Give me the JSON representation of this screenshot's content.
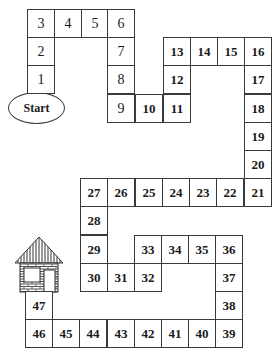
{
  "start_label": "Start",
  "goal": "house-icon",
  "colors": {
    "line": "#3a3a3a",
    "text": "#1a1a1a",
    "background": "#ffffff"
  },
  "cells": [
    {
      "n": "1",
      "x": 27,
      "y": 65,
      "bold": false
    },
    {
      "n": "2",
      "x": 27,
      "y": 37,
      "bold": false
    },
    {
      "n": "3",
      "x": 27,
      "y": 9,
      "bold": false
    },
    {
      "n": "4",
      "x": 54,
      "y": 9,
      "bold": false
    },
    {
      "n": "5",
      "x": 81,
      "y": 9,
      "bold": false
    },
    {
      "n": "6",
      "x": 107,
      "y": 9,
      "bold": false
    },
    {
      "n": "7",
      "x": 107,
      "y": 37,
      "bold": false
    },
    {
      "n": "8",
      "x": 107,
      "y": 65,
      "bold": false
    },
    {
      "n": "9",
      "x": 107,
      "y": 94,
      "bold": false
    },
    {
      "n": "10",
      "x": 135,
      "y": 94,
      "bold": true
    },
    {
      "n": "11",
      "x": 163,
      "y": 94,
      "bold": true
    },
    {
      "n": "12",
      "x": 163,
      "y": 65,
      "bold": true
    },
    {
      "n": "13",
      "x": 163,
      "y": 37,
      "bold": true
    },
    {
      "n": "14",
      "x": 190,
      "y": 37,
      "bold": true
    },
    {
      "n": "15",
      "x": 217,
      "y": 37,
      "bold": true
    },
    {
      "n": "16",
      "x": 244,
      "y": 37,
      "bold": true
    },
    {
      "n": "17",
      "x": 244,
      "y": 65,
      "bold": true
    },
    {
      "n": "18",
      "x": 244,
      "y": 94,
      "bold": true
    },
    {
      "n": "19",
      "x": 244,
      "y": 122,
      "bold": true
    },
    {
      "n": "20",
      "x": 244,
      "y": 150,
      "bold": true
    },
    {
      "n": "21",
      "x": 244,
      "y": 178,
      "bold": true
    },
    {
      "n": "22",
      "x": 216,
      "y": 178,
      "bold": true
    },
    {
      "n": "23",
      "x": 189,
      "y": 178,
      "bold": true
    },
    {
      "n": "24",
      "x": 162,
      "y": 178,
      "bold": true
    },
    {
      "n": "25",
      "x": 135,
      "y": 178,
      "bold": true
    },
    {
      "n": "26",
      "x": 107,
      "y": 178,
      "bold": true
    },
    {
      "n": "27",
      "x": 80,
      "y": 178,
      "bold": true
    },
    {
      "n": "28",
      "x": 80,
      "y": 206,
      "bold": true
    },
    {
      "n": "29",
      "x": 80,
      "y": 235,
      "bold": true
    },
    {
      "n": "30",
      "x": 80,
      "y": 263,
      "bold": true
    },
    {
      "n": "31",
      "x": 107,
      "y": 263,
      "bold": true
    },
    {
      "n": "32",
      "x": 134,
      "y": 263,
      "bold": true
    },
    {
      "n": "33",
      "x": 134,
      "y": 235,
      "bold": true
    },
    {
      "n": "34",
      "x": 161,
      "y": 235,
      "bold": true
    },
    {
      "n": "35",
      "x": 188,
      "y": 235,
      "bold": true
    },
    {
      "n": "36",
      "x": 215,
      "y": 235,
      "bold": true
    },
    {
      "n": "37",
      "x": 215,
      "y": 263,
      "bold": true
    },
    {
      "n": "38",
      "x": 215,
      "y": 291,
      "bold": true
    },
    {
      "n": "39",
      "x": 215,
      "y": 319,
      "bold": true
    },
    {
      "n": "40",
      "x": 188,
      "y": 319,
      "bold": true
    },
    {
      "n": "41",
      "x": 161,
      "y": 319,
      "bold": true
    },
    {
      "n": "42",
      "x": 134,
      "y": 319,
      "bold": true
    },
    {
      "n": "43",
      "x": 107,
      "y": 319,
      "bold": true
    },
    {
      "n": "44",
      "x": 79,
      "y": 319,
      "bold": true
    },
    {
      "n": "45",
      "x": 52,
      "y": 319,
      "bold": true
    },
    {
      "n": "46",
      "x": 25,
      "y": 319,
      "bold": true
    },
    {
      "n": "47",
      "x": 25,
      "y": 291,
      "bold": true
    }
  ],
  "cell_size": {
    "w": 28,
    "h": 29
  }
}
